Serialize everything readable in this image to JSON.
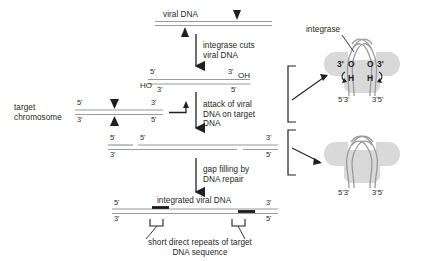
{
  "steps": {
    "step1_label": "viral DNA",
    "step1_arrow_text": "integrase cuts\nviral DNA",
    "step2_arrow_text": "attack of viral\nDNA on target\nDNA",
    "step3_arrow_text": "gap filling by\nDNA repair",
    "step4_label": "integrated viral DNA"
  },
  "left_labels": {
    "target_chromosome": "target\nchromosome"
  },
  "caption": {
    "line1": "short direct repeats of target",
    "line2": "DNA sequence"
  },
  "integrase": {
    "label": "integrase",
    "top_complex": {
      "left_three_prime": "3'",
      "left_O": "O",
      "left_H": "H",
      "right_O": "O",
      "right_three_prime": "3'",
      "right_H": "H",
      "foot_left": "5'3'",
      "foot_right": "3'5'"
    },
    "bottom_complex": {
      "foot_left": "5'3'",
      "foot_right": "3'5'"
    }
  },
  "primes": {
    "row1": [],
    "row2": {
      "top_left": "5'",
      "top_right": "3'",
      "top_right_oh": "OH",
      "bottom_left_ho": "HO",
      "bottom_left": "3'",
      "bottom_right": "5'"
    },
    "row3_target": {
      "top_left": "5'",
      "top_right": "3'",
      "bottom_left": "3'",
      "bottom_right": "5'"
    },
    "row4": {
      "top_left": "5'",
      "top_mid": "5'",
      "top_right": "3'",
      "bottom_left": "3'",
      "bottom_right": "5'"
    },
    "row5": {
      "top_left": "5'",
      "top_mid": "5'",
      "top_right": "3'",
      "bottom_left": "3'",
      "bottom_right": "5'"
    },
    "row6": {
      "top_left": "5'",
      "top_right": "3'",
      "bottom_left": "3'",
      "bottom_right": "5'"
    }
  },
  "colors": {
    "strand": "#9a9a9a",
    "text": "#231f20",
    "protein_fill": "#d9d9d9",
    "black_segment": "#1a1a1a"
  }
}
